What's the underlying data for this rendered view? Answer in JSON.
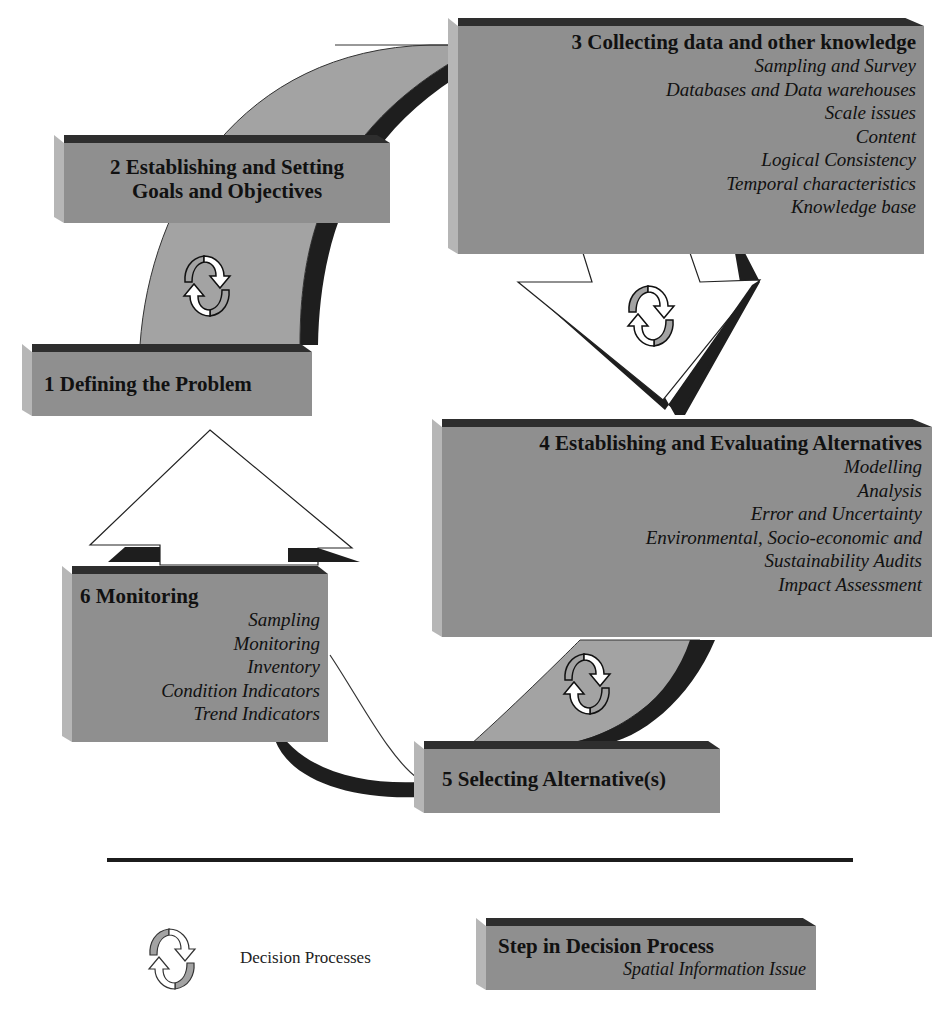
{
  "diagram": {
    "steps": [
      {
        "id": 1,
        "title": "1 Defining the Problem",
        "issues": []
      },
      {
        "id": 2,
        "title_line1": "2 Establishing and Setting",
        "title_line2": "Goals and Objectives",
        "issues": []
      },
      {
        "id": 3,
        "title": "3 Collecting data and other knowledge",
        "issues": [
          "Sampling and Survey",
          "Databases and Data warehouses",
          "Scale issues",
          "Content",
          "Logical Consistency",
          "Temporal characteristics",
          "Knowledge base"
        ]
      },
      {
        "id": 4,
        "title": "4 Establishing and Evaluating Alternatives",
        "issues": [
          "Modelling",
          "Analysis",
          "Error and Uncertainty",
          "Environmental, Socio-economic and",
          "Sustainability Audits",
          "Impact Assessment"
        ]
      },
      {
        "id": 5,
        "title": "5 Selecting Alternative(s)",
        "issues": []
      },
      {
        "id": 6,
        "title": "6 Monitoring",
        "issues": [
          "Sampling",
          "Monitoring",
          "Inventory",
          "Condition Indicators",
          "Trend Indicators"
        ]
      }
    ],
    "colors": {
      "box_face": "#8f8f8f",
      "box_top": "#2e2e2e",
      "box_side": "#b6b6b6",
      "arrow_face": "#a3a3a3",
      "arrow_shadow": "#1e1e1e"
    }
  },
  "legend": {
    "cycle_label": "Decision Processes",
    "box_title": "Step in Decision Process",
    "box_subtitle": "Spatial Information Issue"
  }
}
